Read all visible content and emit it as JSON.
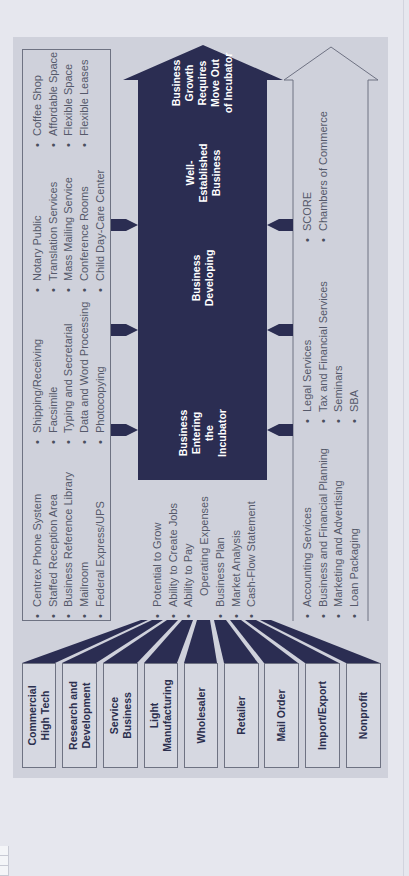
{
  "diagram": {
    "categories": [
      {
        "line1": "Commercial",
        "line2": "High Tech"
      },
      {
        "line1": "Research and",
        "line2": "Development"
      },
      {
        "line1": "Service",
        "line2": "Business"
      },
      {
        "line1": "Light",
        "line2": "Manufacturing"
      },
      {
        "line1": "Wholesaler",
        "line2": ""
      },
      {
        "line1": "Retailer",
        "line2": ""
      },
      {
        "line1": "Mail Order",
        "line2": ""
      },
      {
        "line1": "Import/Export",
        "line2": ""
      },
      {
        "line1": "Nonprofit",
        "line2": ""
      }
    ],
    "entry_criteria": [
      "Potential to Grow",
      "Ability to Create Jobs",
      "Ability to Pay",
      "Operating Expenses",
      "Business Plan",
      "Market Analysis",
      "Cash-Flow Statement"
    ],
    "shared_services": {
      "col1": [
        "Centrex Phone System",
        "Staffed Reception Area",
        "Business Reference Library",
        "Mailroom",
        "Federal Express/UPS"
      ],
      "col2": [
        "Shipping/Receiving",
        "Facsimile",
        "Typing and Secretarial",
        "Data and Word Processing",
        "Photocopying"
      ],
      "col3": [
        "Notary Public",
        "Translation Services",
        "Mass Mailing Service",
        "Conference Rooms",
        "Child Day-Care Center"
      ],
      "col4": [
        "Coffee Shop",
        "Affordable Space",
        "Flexible Space",
        "Flexible Leases"
      ]
    },
    "professional_services": {
      "col1": [
        "Accounting Services",
        "Business and Financial Planning",
        "Marketing and Advertising",
        "Loan Packaging"
      ],
      "col2": [
        "Legal Services",
        "Tax and Financial Services",
        "Seminars",
        "SBA"
      ],
      "col3": [
        "SCORE",
        "Chambers of Commerce"
      ]
    },
    "stages": [
      {
        "lines": [
          "Business",
          "Entering",
          "the",
          "Incubator"
        ]
      },
      {
        "lines": [
          "Business",
          "Developing"
        ]
      },
      {
        "lines": [
          "Well-",
          "Established",
          "Business"
        ]
      },
      {
        "lines": [
          "Business",
          "Growth",
          "Requires",
          "Move Out",
          "of Incubator"
        ]
      }
    ],
    "colors": {
      "dark_navy": "#2b2d52",
      "panel_gray": "#cfd1db",
      "page_bg": "#e6e7ee",
      "text_gray": "#55596a"
    }
  }
}
